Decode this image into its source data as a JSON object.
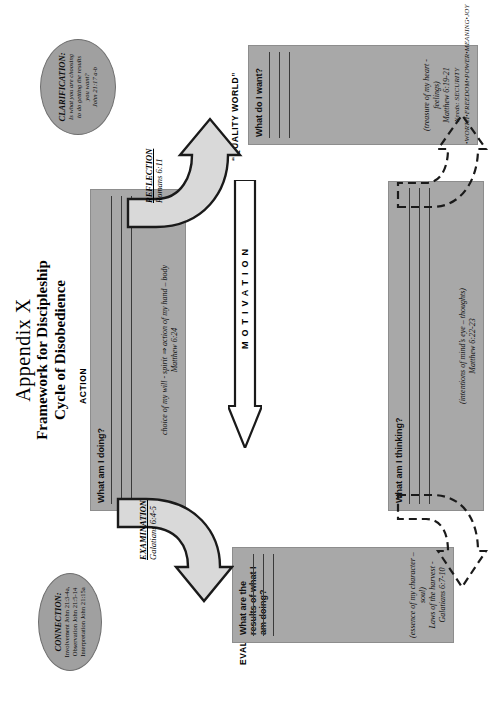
{
  "document": {
    "title_line1": "Appendix X",
    "title_line2": "Framework for Discipleship",
    "title_line3": "Cycle of Disobedience"
  },
  "sections": {
    "action": {
      "caption": "ACTION",
      "question": "What am I doing?",
      "footnote": "choice of my will - spirit ⇒ action of my hand – body",
      "scripture": "Matthew 6:24",
      "rule_count": 3
    },
    "evaluation": {
      "caption": "EVALUATION",
      "question": "What are the results of what I am doing?",
      "footnote": "(essence of my character – soul)",
      "scripture": "Laws of the harvest - Galatians 6:7-10",
      "rule_count": 3
    },
    "quality_world": {
      "caption": "“QUALITY WORLD”",
      "question": "What do I want?",
      "footnote": "(treasure of my heart - feelings)",
      "scripture": "Matthew 6:19-21",
      "needs": "Needs: SECURITY •WORTH•FREEDOM•POWER•MEANING•JOY",
      "rule_count": 3
    },
    "application": {
      "caption": "APPLICATION",
      "question": "What am I thinking?",
      "footnote": "(intentions of mind’s eye – thoughts)",
      "scripture": "Matthew 6:22-23",
      "rule_count": 3
    }
  },
  "center_arrow": {
    "label": "MOTIVATION"
  },
  "process_labels": {
    "examination": {
      "name": "EXAMINATION",
      "scripture": "Galatians 6:4-5"
    },
    "reflection": {
      "name": "REFLECTION",
      "scripture": "Romans 6:11"
    }
  },
  "callouts": {
    "connection": {
      "heading": "CONNECTION:",
      "line1": "Involvement John 21:3-4a,",
      "line2": "Observation John 21:5-14",
      "line3": "Interpretation John 21:15a"
    },
    "clarification": {
      "heading": "CLARIFICATION:",
      "line1": "Is what you are choosing",
      "line2": "to do getting the results",
      "line3": "you want?",
      "line4": "John 21:17 a-b"
    }
  },
  "colors": {
    "box_fill": "#a8a8a8",
    "oval_fill": "#a0a0a0",
    "rule_line": "#3a3a3a",
    "outline": "#1a1a1a",
    "arrow_fill": "#d9d9d9"
  }
}
